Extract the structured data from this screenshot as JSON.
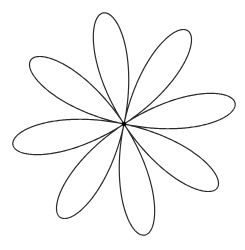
{
  "figure": {
    "type": "rose-curve",
    "petals": 8,
    "k": 4,
    "center": [
      124,
      124
    ],
    "radius": 113,
    "rotation_deg": -10.6,
    "stroke_color": "#2a2a2a",
    "stroke_width": 1.2,
    "background": "#ffffff",
    "center_dot_radius": 2.2
  }
}
